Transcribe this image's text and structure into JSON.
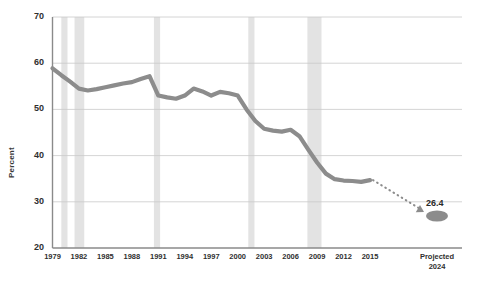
{
  "chart_data": {
    "type": "line",
    "title": "",
    "xlabel": "",
    "ylabel": "Percent",
    "ylim": [
      20,
      70
    ],
    "yticks": [
      20,
      30,
      40,
      50,
      60,
      70
    ],
    "ytick_labels": [
      "20",
      "30",
      "40",
      "50",
      "60",
      "70"
    ],
    "grid": true,
    "legend": "none",
    "x": [
      1979,
      1980,
      1981,
      1982,
      1983,
      1984,
      1985,
      1986,
      1987,
      1988,
      1989,
      1990,
      1991,
      1992,
      1993,
      1994,
      1995,
      1996,
      1997,
      1998,
      1999,
      2000,
      2001,
      2002,
      2003,
      2004,
      2005,
      2006,
      2007,
      2008,
      2009,
      2010,
      2011,
      2012,
      2013,
      2014,
      2015
    ],
    "xtick_labels": [
      "1979",
      "1982",
      "1985",
      "1988",
      "1991",
      "1994",
      "1997",
      "2000",
      "2003",
      "2006",
      "2009",
      "2012",
      "2015"
    ],
    "xticks": [
      1979,
      1982,
      1985,
      1988,
      1991,
      1994,
      1997,
      2000,
      2003,
      2006,
      2009,
      2012,
      2015
    ],
    "values": [
      58.9,
      57.4,
      56.0,
      54.5,
      54.1,
      54.4,
      54.8,
      55.2,
      55.6,
      55.9,
      56.6,
      57.2,
      53.0,
      52.6,
      52.3,
      53.0,
      54.5,
      53.9,
      53.0,
      53.8,
      53.5,
      53.0,
      50.0,
      47.5,
      45.8,
      45.4,
      45.2,
      45.6,
      44.2,
      41.3,
      38.5,
      36.1,
      34.9,
      34.6,
      34.5,
      34.3,
      34.7
    ],
    "projection": {
      "label": "26.4",
      "value": 26.4,
      "axis_label_line1": "Projected",
      "axis_label_line2": "2024",
      "line_style": "dotted",
      "arrow": true,
      "marker": "ellipse"
    },
    "shaded_bands": [
      {
        "start": 1980.0,
        "end": 1980.7
      },
      {
        "start": 1981.5,
        "end": 1982.6
      },
      {
        "start": 1990.5,
        "end": 1991.2
      },
      {
        "start": 2001.2,
        "end": 2001.9
      },
      {
        "start": 2007.9,
        "end": 2009.5
      }
    ],
    "colors": {
      "line": "#8c8c8c",
      "band": "#d9d9d9",
      "grid": "#c9c9c9",
      "axis": "#808080",
      "text": "#2f2f2f",
      "background": "#ffffff"
    }
  }
}
